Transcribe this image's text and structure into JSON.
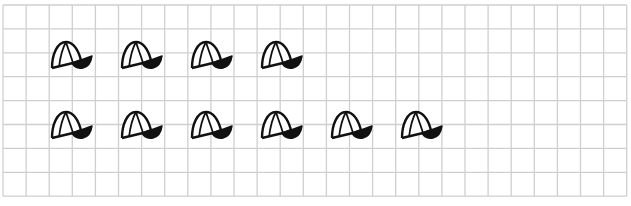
{
  "worksheet": {
    "grid": {
      "left": 3,
      "top": 5,
      "cols": 27,
      "rows": 8,
      "cell_w": 23.1,
      "cell_h": 23.9,
      "line_color": "#cfcfcf"
    },
    "rows": [
      {
        "label": "row-1",
        "count": 4,
        "y": 39,
        "xs": [
          50,
          120,
          190,
          260
        ]
      },
      {
        "label": "row-2",
        "count": 6,
        "y": 109,
        "xs": [
          50,
          120,
          190,
          260,
          330,
          400
        ]
      }
    ],
    "icon": "baseball-cap-icon",
    "ink_color": "#111111"
  }
}
